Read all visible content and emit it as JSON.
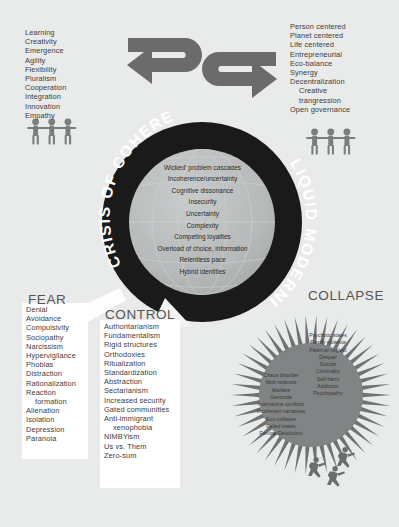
{
  "poster": {
    "title": "Crisis of Coherence / Liquid Modernity",
    "background_color": "#e9eaea",
    "ring_color": "#1a1a1a",
    "arrow_color": "#6b6b6b",
    "globe_color": "#b9bcbc",
    "panel_color": "#ffffff",
    "heading_color": "#555555"
  },
  "quadrants": {
    "top_left": {
      "name": "positive-adaptive-values",
      "items": [
        "Learning",
        "Creativity",
        "Emergence",
        "Agility",
        "Flexibility",
        "Pluralism",
        "Cooperation",
        "Integration",
        "Innovation",
        "Empathy"
      ],
      "icon": "three-people-linked-icon"
    },
    "top_right": {
      "name": "regenerative-values",
      "items": [
        "Person centered",
        "Planet centered",
        "Life centered",
        "Entrepreneurial",
        "Eco-balance",
        "Synergy",
        "Decentralization",
        "Creative",
        "trangression",
        "Open governance"
      ],
      "indented": [
        7,
        8
      ],
      "icon": "three-people-linked-icon"
    }
  },
  "ring": {
    "left_label": "CRISIS OF COHERENCE",
    "right_label": "LIQUID MODERNITY"
  },
  "globe": {
    "name": "globe-core",
    "lines": [
      "Wicked' problem cascades",
      "Incoherence/uncertainty",
      "Cognitive dissonance",
      "Insecurity",
      "Uncertainty",
      "Complexity",
      "Competing loyalties",
      "Overload of choice, information",
      "Relentless pace",
      "Hybrid identities"
    ]
  },
  "fear": {
    "heading": "FEAR",
    "items": [
      "Denial",
      "Avoidance",
      "Compulsivity",
      "Sociopathy",
      "Narcissism",
      "Hypervigilance",
      "Phobias",
      "Distraction",
      "Rationalization",
      "Reaction",
      "formation",
      "Alienation",
      "Isolation",
      "Depression",
      "Paranoia"
    ],
    "indented": [
      10
    ]
  },
  "control": {
    "heading": "CONTROL",
    "items": [
      "Authoritarianism",
      "Fundamentalism",
      "Rigid structures",
      "Orthodoxies",
      "Ritualization",
      "Standardization",
      "Abstraction",
      "Sectarianism",
      "Increased security",
      "Gated communities",
      "Anti-immigrant",
      "xenophobia",
      "NIMBYism",
      "Us vs. Them",
      "Zero-sum"
    ],
    "indented": [
      11
    ]
  },
  "collapse": {
    "heading": "COLLAPSE",
    "societal_items": [
      "Chaos disorder",
      "Mob violence",
      "Warfare",
      "Genocide",
      "Internecine conflicts",
      "Incoherent narratives",
      "Eco-collapse",
      "Failed states",
      "Famine/Destitution"
    ],
    "personal_items": [
      "Psychotic states",
      "Family violence",
      "Paternal neglect",
      "Despair",
      "Suicide",
      "Criminality",
      "Self-harm",
      "Addiction",
      "Psychopathy"
    ],
    "icon": "three-running-people-icon"
  },
  "arrows": {
    "top_left_arrow": "u-turn-arrow-right-icon",
    "top_right_arrow": "u-turn-arrow-left-icon",
    "control_pointer": "white-arrow-into-ring-icon",
    "fear_pointer": "white-wedge-icon"
  }
}
